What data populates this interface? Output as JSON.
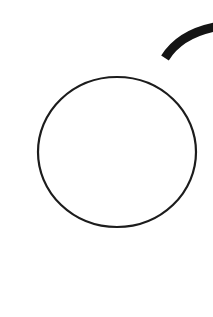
{
  "canvas": {
    "width": 213,
    "height": 317,
    "background": "#ffffff"
  },
  "shapes": {
    "circle": {
      "cx": 117,
      "cy": 152,
      "rx": 79,
      "ry": 75,
      "stroke": "#1c1c1c",
      "stroke_width": 2.2,
      "fill": "none"
    },
    "arc": {
      "path": "M 165 58 Q 180 34 215 27",
      "stroke": "#141414",
      "stroke_width": 9,
      "fill": "none"
    }
  }
}
